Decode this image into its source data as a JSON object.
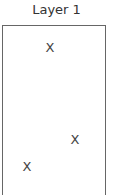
{
  "layer": {
    "title": "Layer 1",
    "marks": [
      {
        "label": "X",
        "x": 50,
        "y": 48
      },
      {
        "label": "X",
        "x": 75,
        "y": 140
      },
      {
        "label": "X",
        "x": 27,
        "y": 167
      }
    ]
  }
}
